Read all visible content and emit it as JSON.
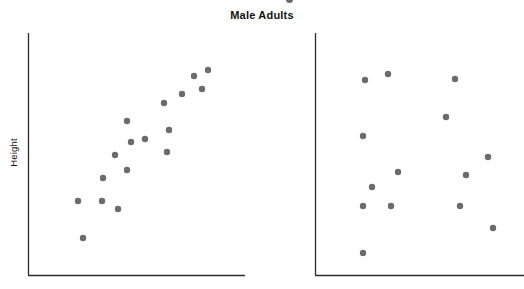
{
  "figure": {
    "title": "Male Adults",
    "background_color": "#ffffff",
    "axis_color": "#2b2b2b",
    "point_color": "#6b6b6b",
    "point_radius_px": 3.2
  },
  "chart_data": [
    {
      "type": "scatter",
      "name": "left-panel",
      "title": "Male Adults",
      "xlabel": "",
      "ylabel": "Height",
      "grid": false,
      "legend": "none",
      "axes": {
        "show_ticks": false,
        "show_tick_labels": false,
        "spines": [
          "left",
          "bottom"
        ]
      },
      "plot_box_px": {
        "x0": 28,
        "y0": 33,
        "x1": 245,
        "y1": 275
      },
      "relationship": "positive linear association",
      "n_points": 17,
      "points_px": [
        [
          83,
          238
        ],
        [
          78,
          201
        ],
        [
          102,
          201
        ],
        [
          118,
          209
        ],
        [
          103,
          178
        ],
        [
          127,
          170
        ],
        [
          115,
          155
        ],
        [
          131,
          142
        ],
        [
          127,
          121
        ],
        [
          145,
          139
        ],
        [
          164,
          103
        ],
        [
          167,
          152
        ],
        [
          169,
          130
        ],
        [
          182,
          94
        ],
        [
          194,
          76
        ],
        [
          202,
          89
        ],
        [
          208,
          70
        ]
      ]
    },
    {
      "type": "scatter",
      "name": "right-panel",
      "title": "",
      "xlabel": "",
      "ylabel": "Height",
      "grid": false,
      "legend": "none",
      "axes": {
        "show_ticks": false,
        "show_tick_labels": false,
        "spines": [
          "left",
          "bottom"
        ]
      },
      "plot_box_px": {
        "x0": 315,
        "y0": 33,
        "x1": 524,
        "y1": 275
      },
      "relationship": "no association / random scatter",
      "n_points": 14,
      "points_px": [
        [
          365,
          80
        ],
        [
          388,
          74
        ],
        [
          363,
          136
        ],
        [
          372,
          187
        ],
        [
          363,
          206
        ],
        [
          363,
          253
        ],
        [
          398,
          172
        ],
        [
          391,
          206
        ],
        [
          455,
          79
        ],
        [
          446,
          117
        ],
        [
          460,
          206
        ],
        [
          466,
          175
        ],
        [
          488,
          157
        ],
        [
          493,
          228
        ]
      ]
    }
  ],
  "panels": {
    "left": {
      "ylabel": "Height"
    },
    "right": {
      "ylabel": "Height"
    }
  }
}
